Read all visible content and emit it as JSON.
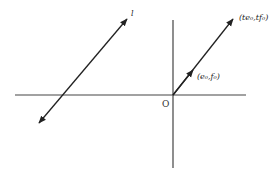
{
  "diagram": {
    "type": "vector-line-diagram",
    "colors": {
      "stroke": "#333333",
      "background": "#ffffff"
    },
    "axes": {
      "horizontal": {
        "x1": 15,
        "y1": 95,
        "x2": 246,
        "y2": 95
      },
      "vertical": {
        "x1": 173,
        "y1": 20,
        "x2": 173,
        "y2": 168
      }
    },
    "origin": {
      "label": "O",
      "x": 173,
      "y": 95,
      "label_x": 163,
      "label_y": 108
    },
    "ray": {
      "from": [
        173,
        95
      ],
      "to": [
        233,
        19
      ],
      "mid_arrow": [
        193,
        70
      ],
      "mid_label": "(e₀,f₀)",
      "end_label": "(te₀,tf₀)"
    },
    "line_l": {
      "label": "l",
      "from": [
        39,
        123
      ],
      "to": [
        127,
        19
      ]
    }
  }
}
